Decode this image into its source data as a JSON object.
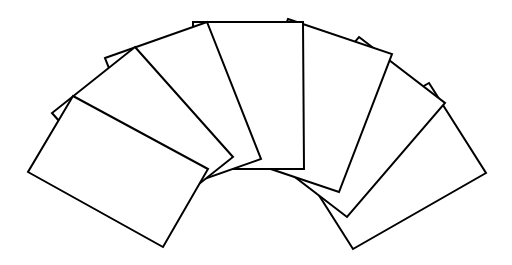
{
  "figure": {
    "background": "#ffffff",
    "stroke_color": "#000000",
    "fill_color": "#ffffff",
    "stroke_width": 2,
    "card_count": 7,
    "stacking": "left cards on top; drawn back (rightmost) to front (leftmost)"
  },
  "cards": [
    {
      "id": "card-7",
      "points": [
        [
          429,
          83
        ],
        [
          486,
          173
        ],
        [
          353,
          249
        ],
        [
          296,
          159
        ]
      ]
    },
    {
      "id": "card-6",
      "points": [
        [
          359,
          37
        ],
        [
          445,
          103
        ],
        [
          347,
          217
        ],
        [
          261,
          151
        ]
      ]
    },
    {
      "id": "card-5",
      "points": [
        [
          288,
          19
        ],
        [
          392,
          54
        ],
        [
          339,
          192
        ],
        [
          235,
          157
        ]
      ]
    },
    {
      "id": "card-4",
      "points": [
        [
          193,
          22
        ],
        [
          303,
          22
        ],
        [
          304,
          169
        ],
        [
          194,
          169
        ]
      ]
    },
    {
      "id": "card-3",
      "points": [
        [
          105,
          58
        ],
        [
          207,
          22
        ],
        [
          261,
          159
        ],
        [
          159,
          195
        ]
      ]
    },
    {
      "id": "card-2",
      "points": [
        [
          135,
          47
        ],
        [
          233,
          157
        ],
        [
          150,
          223
        ],
        [
          52,
          113
        ]
      ]
    },
    {
      "id": "card-1",
      "points": [
        [
          73,
          96
        ],
        [
          208,
          169
        ],
        [
          163,
          247
        ],
        [
          28,
          172
        ]
      ]
    }
  ]
}
